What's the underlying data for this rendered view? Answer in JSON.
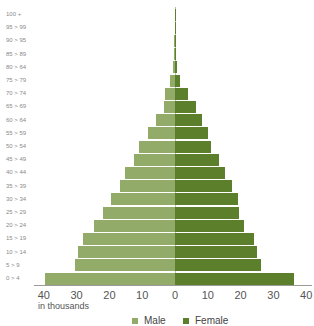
{
  "chart_data": {
    "type": "bar",
    "subtype": "population-pyramid",
    "title": "",
    "xlabel": "in thousands",
    "ylabel": "",
    "xlim": [
      -40,
      40
    ],
    "x_ticks": [
      "40",
      "30",
      "20",
      "10",
      "0",
      "10",
      "20",
      "30",
      "40"
    ],
    "grid": false,
    "legend_position": "bottom",
    "categories": [
      "0 > 4",
      "5 > 9",
      "10 > 14",
      "15 > 19",
      "20 > 24",
      "25 > 29",
      "30 > 34",
      "35 > 39",
      "40 > 44",
      "45 > 49",
      "50 > 54",
      "55 > 59",
      "60 > 64",
      "65 > 69",
      "70 > 74",
      "75 > 79",
      "80 > 64",
      "85 > 89",
      "90 > 95",
      "95 > 99",
      "100 +"
    ],
    "series": [
      {
        "name": "Male",
        "color": "#93ab69",
        "values": [
          39.5,
          30.5,
          29.5,
          28,
          24.7,
          22,
          19.5,
          16.7,
          15.2,
          12.5,
          11,
          8.2,
          5.9,
          3.3,
          3.1,
          1.5,
          0.6,
          0.2,
          0.2,
          0.1,
          0.1
        ]
      },
      {
        "name": "Female",
        "color": "#5b7f2b",
        "values": [
          36.2,
          26.2,
          25,
          24,
          21.1,
          19.6,
          19.3,
          17.3,
          15.2,
          13.5,
          11,
          10.2,
          8.1,
          6.5,
          3.9,
          1.5,
          0.6,
          0.2,
          0.2,
          0.1,
          0.1
        ]
      }
    ]
  },
  "legend": {
    "male_label": "Male",
    "female_label": "Female",
    "male_color": "#93ab69",
    "female_color": "#5b7f2b"
  },
  "axis": {
    "unit_label": "in thousands"
  }
}
